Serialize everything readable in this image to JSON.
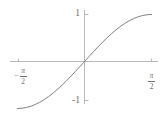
{
  "chart_data": {
    "type": "line",
    "title": "",
    "subtitle": "",
    "xlabel": "",
    "ylabel": "",
    "function": "sin(x)",
    "xlim": [
      -1.5708,
      1.5708
    ],
    "ylim": [
      -1,
      1
    ],
    "grid": false,
    "legend": null,
    "series": [
      {
        "name": "sin(x)",
        "color": "#808080",
        "x": [
          -1.5708,
          -1.4661,
          -1.3614,
          -1.2566,
          -1.1519,
          -1.0472,
          -0.9425,
          -0.8378,
          -0.733,
          -0.6283,
          -0.5236,
          -0.4189,
          -0.3142,
          -0.2094,
          -0.1047,
          0,
          0.1047,
          0.2094,
          0.3142,
          0.4189,
          0.5236,
          0.6283,
          0.733,
          0.8378,
          0.9425,
          1.0472,
          1.1519,
          1.2566,
          1.3614,
          1.4661,
          1.5708
        ],
        "y": [
          -1,
          -0.9945,
          -0.9781,
          -0.9511,
          -0.9135,
          -0.866,
          -0.809,
          -0.7431,
          -0.6691,
          -0.5878,
          -0.5,
          -0.4067,
          -0.309,
          -0.2079,
          -0.1045,
          0,
          0.1045,
          0.2079,
          0.309,
          0.4067,
          0.5,
          0.5878,
          0.6691,
          0.7431,
          0.809,
          0.866,
          0.9135,
          0.9511,
          0.9781,
          0.9945,
          1
        ]
      }
    ],
    "x_ticks": [
      {
        "value": -1.5708,
        "label": "-π/2",
        "minus": "−",
        "numerator": "π",
        "denominator": "2"
      },
      {
        "value": 1.5708,
        "label": "π/2",
        "minus": "",
        "numerator": "π",
        "denominator": "2"
      }
    ],
    "y_ticks": [
      {
        "value": 1,
        "label": "1"
      },
      {
        "value": -1,
        "label": "-1"
      }
    ],
    "axis_color": "#a8a8a8",
    "tick_color": "#a8a8a8",
    "label_color": "#6e6e6e",
    "background": "#ffffff"
  },
  "axes": {
    "x_axis_label": "",
    "y_axis_label": ""
  }
}
